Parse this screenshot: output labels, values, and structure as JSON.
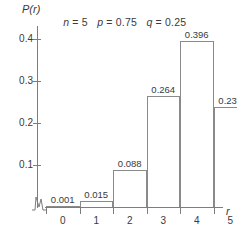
{
  "chart_data": {
    "type": "bar",
    "title_parts": {
      "n_var": "n",
      "n_val": " = 5",
      "p_var": "p",
      "p_val": " = 0.75",
      "q_var": "q",
      "q_val": " = 0.25"
    },
    "xlabel": "r",
    "ylabel": "P(r)",
    "categories": [
      "0",
      "1",
      "2",
      "3",
      "4",
      "5"
    ],
    "values": [
      0.001,
      0.015,
      0.088,
      0.264,
      0.396,
      0.237
    ],
    "value_labels": [
      "0.001",
      "0.015",
      "0.088",
      "0.264",
      "0.396",
      "0.237"
    ],
    "ytick_labels": [
      "0.1",
      "0.2",
      "0.3",
      "0.4"
    ],
    "ytick_values": [
      0.1,
      0.2,
      0.3,
      0.4
    ],
    "ylim": [
      0,
      0.44
    ],
    "xlim": [
      -0.5,
      5.5
    ],
    "grid": false,
    "legend": null,
    "axis_break": "y-axis zigzag break near origin",
    "bar_fill": "#ffffff",
    "bar_stroke": "#8a8a8a",
    "axis_color": "#7d7d7d",
    "text_color": "#3a3a3a",
    "background": "#ffffff"
  }
}
